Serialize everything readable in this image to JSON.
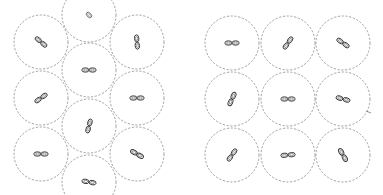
{
  "figure": {
    "circle_radius": 27,
    "colors": {
      "circle_stroke": "#8a8a8a",
      "orbital_stroke": "#333333",
      "background": "#ffffff"
    }
  },
  "panels": [
    {
      "name": "left-panel",
      "packing": "hexagonal",
      "clip": {
        "x": 12,
        "y": 0,
        "w": 166,
        "h": 195
      },
      "cells": [
        {
          "cx": 41,
          "cy": 42,
          "angle": 40
        },
        {
          "cx": 41,
          "cy": 98,
          "angle": -35
        },
        {
          "cx": 41,
          "cy": 154,
          "angle": 0
        },
        {
          "cx": 89,
          "cy": 15,
          "angle": 45,
          "small": true
        },
        {
          "cx": 89,
          "cy": 70,
          "angle": 0
        },
        {
          "cx": 89,
          "cy": 126,
          "angle": -75
        },
        {
          "cx": 89,
          "cy": 182,
          "angle": 10
        },
        {
          "cx": 137,
          "cy": 42,
          "angle": 85
        },
        {
          "cx": 137,
          "cy": 98,
          "angle": 0
        },
        {
          "cx": 137,
          "cy": 154,
          "angle": 30
        }
      ]
    },
    {
      "name": "right-panel",
      "packing": "square",
      "clip": {
        "x": 200,
        "y": 0,
        "w": 183,
        "h": 195
      },
      "cells": [
        {
          "cx": 232,
          "cy": 43,
          "angle": 0
        },
        {
          "cx": 288,
          "cy": 43,
          "angle": -55
        },
        {
          "cx": 343,
          "cy": 43,
          "angle": 35
        },
        {
          "cx": 232,
          "cy": 99,
          "angle": -65
        },
        {
          "cx": 288,
          "cy": 99,
          "angle": 0
        },
        {
          "cx": 343,
          "cy": 99,
          "angle": 15
        },
        {
          "cx": 232,
          "cy": 155,
          "angle": -55
        },
        {
          "cx": 288,
          "cy": 155,
          "angle": -5
        },
        {
          "cx": 343,
          "cy": 155,
          "angle": 60
        }
      ],
      "marks": [
        {
          "x1": 366,
          "y1": 111,
          "x2": 371,
          "y2": 113
        }
      ]
    }
  ]
}
